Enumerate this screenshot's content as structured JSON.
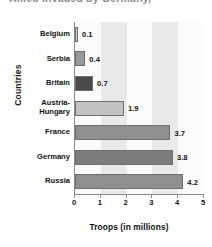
{
  "title": {
    "text": "Allied Invaded by Germany,",
    "clipped": true
  },
  "axis": {
    "ylabel": "Countries",
    "xlabel": "Troops (in millions)",
    "xticks": [
      "0",
      "1",
      "2",
      "3",
      "4",
      "5"
    ]
  },
  "chart_data": {
    "type": "bar",
    "orientation": "horizontal",
    "title": "",
    "xlabel": "Troops (in millions)",
    "ylabel": "Countries",
    "xlim": [
      0,
      5
    ],
    "grid": false,
    "legend": null,
    "categories": [
      "Belgium",
      "Serbia",
      "Britain",
      "Austria-Hungary",
      "France",
      "Germany",
      "Russia"
    ],
    "values": [
      0.1,
      0.4,
      0.7,
      1.9,
      3.7,
      3.8,
      4.2
    ],
    "value_labels": [
      "0.1",
      "0.4",
      "0.7",
      "1.9",
      "3.7",
      "3.8",
      "4.2"
    ],
    "bar_colors": [
      "#cfcfcf",
      "#9a9a9a",
      "#4a4a4a",
      "#c2c2c2",
      "#8f8f8f",
      "#7c7c7c",
      "#8f8f8f"
    ],
    "band_colors": [
      "#fbfbfb",
      "#e9e9e9"
    ]
  }
}
